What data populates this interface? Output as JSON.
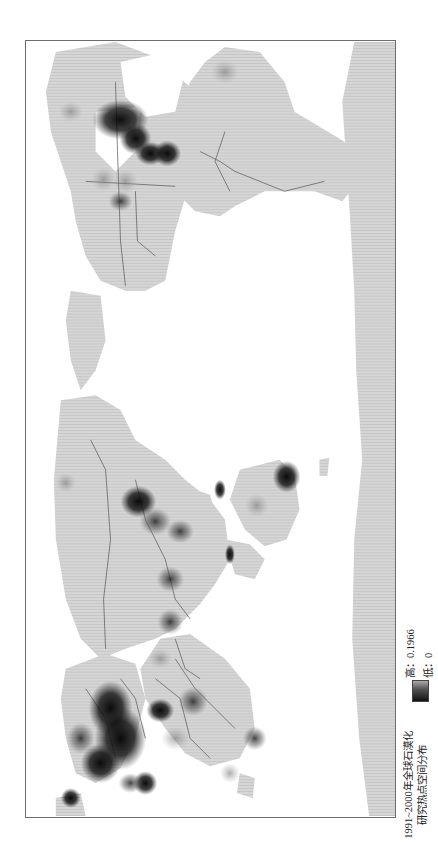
{
  "map": {
    "orientation": "rotated-90-clockwise",
    "projection": "world map, Pacific-centered",
    "land_color": "#d2d2d2",
    "border_color": "#555555",
    "ocean_color": "#ffffff",
    "hotspots": [
      {
        "region": "north-america-great-lakes",
        "intensity": "high"
      },
      {
        "region": "north-america-northeast",
        "intensity": "high"
      },
      {
        "region": "north-america-southeast",
        "intensity": "high"
      },
      {
        "region": "north-america-central",
        "intensity": "low"
      },
      {
        "region": "europe",
        "intensity": "high"
      },
      {
        "region": "mediterranean",
        "intensity": "high"
      },
      {
        "region": "middle-east",
        "intensity": "medium"
      },
      {
        "region": "africa-east",
        "intensity": "medium"
      },
      {
        "region": "madagascar",
        "intensity": "medium"
      },
      {
        "region": "south-africa",
        "intensity": "low"
      },
      {
        "region": "china-north",
        "intensity": "high"
      },
      {
        "region": "china-central",
        "intensity": "medium"
      },
      {
        "region": "china-south",
        "intensity": "medium"
      },
      {
        "region": "india",
        "intensity": "medium"
      },
      {
        "region": "southeast-asia",
        "intensity": "medium"
      },
      {
        "region": "siberia",
        "intensity": "low"
      },
      {
        "region": "australia-east",
        "intensity": "high"
      },
      {
        "region": "australia-central",
        "intensity": "low"
      },
      {
        "region": "south-america-north",
        "intensity": "low"
      }
    ]
  },
  "legend": {
    "title_line1": "1991~2000年全球石漠化",
    "title_line2": "研究热点空间分布",
    "high_label": "高：0.1966",
    "low_label": "低：0",
    "high_value": 0.1966,
    "low_value": 0
  }
}
